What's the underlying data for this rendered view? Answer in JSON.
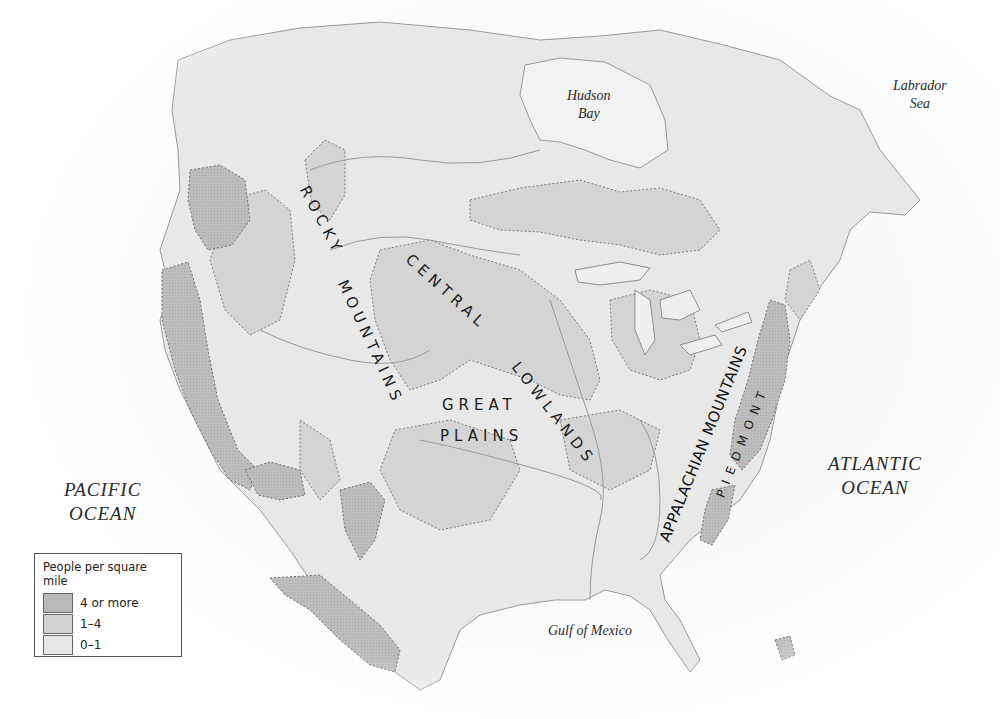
{
  "map": {
    "title": "Population density of North America (pre-contact)",
    "colors": {
      "high": "#b9b9b9",
      "medium": "#d3d3d3",
      "low": "#e6e6e6",
      "border": "#8a8a8a",
      "background": "#ffffff"
    },
    "water_labels": {
      "hudson_bay": [
        "Hudson",
        "Bay"
      ],
      "labrador_sea": [
        "Labrador",
        "Sea"
      ],
      "pacific_ocean": [
        "PACIFIC",
        "OCEAN"
      ],
      "atlantic_ocean": [
        "ATLANTIC",
        "OCEAN"
      ],
      "gulf_of_mexico": "Gulf of Mexico"
    },
    "region_labels": {
      "rocky_1": "ROCKY",
      "rocky_2": "MOUNTAINS",
      "central_1": "CENTRAL",
      "central_2": "LOWLANDS",
      "great": "GREAT",
      "plains": "PLAINS",
      "appalachian": "APPALACHIAN MOUNTAINS",
      "piedmont": "PIEDMONT"
    }
  },
  "legend": {
    "title": "People per square mile",
    "items": [
      {
        "label": "4 or more",
        "color": "#b9b9b9"
      },
      {
        "label": "1–4",
        "color": "#d3d3d3"
      },
      {
        "label": "0–1",
        "color": "#e6e6e6"
      }
    ]
  }
}
